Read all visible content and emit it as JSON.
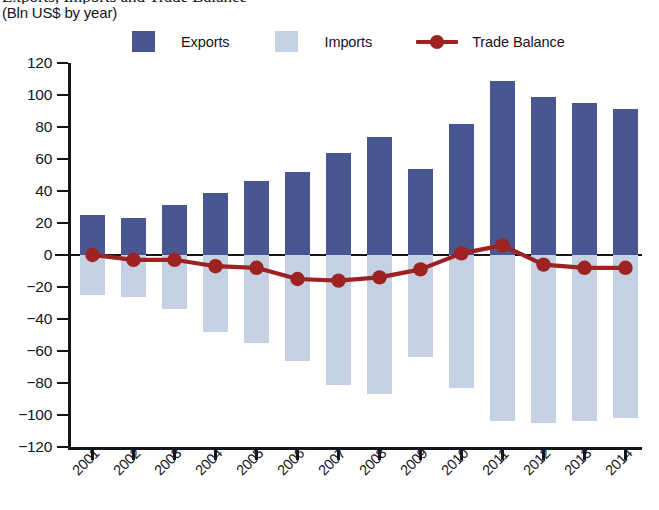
{
  "header": {
    "title": "Exports, Imports and Trade Balance",
    "subtitle": "(Bln US$ by year)"
  },
  "legend": {
    "items": [
      {
        "label": "Exports",
        "type": "swatch",
        "color": "#4a5691",
        "icon": "square-swatch"
      },
      {
        "label": "Imports",
        "type": "swatch",
        "color": "#c3d1e2",
        "icon": "square-swatch"
      },
      {
        "label": "Trade Balance",
        "type": "line",
        "color": "#9e2222",
        "icon": "line-marker"
      }
    ]
  },
  "colors": {
    "exports": "#4a5691",
    "imports": "#c3d1e2",
    "trade_balance": "#9e2222",
    "axis": "#15151d",
    "background": "#ffffff"
  },
  "chart_data": {
    "type": "bar",
    "title": "Exports, Imports and Trade Balance",
    "subtitle": "(Bln US$ by year)",
    "xlabel": "",
    "ylabel": "",
    "unit": "Bln US$",
    "grid": false,
    "legend_position": "top",
    "ylim": [
      -120,
      120
    ],
    "yticks": [
      120,
      100,
      80,
      60,
      40,
      20,
      0,
      -20,
      -40,
      -60,
      -80,
      -100,
      -120
    ],
    "ytick_labels": [
      "120",
      "100",
      "80",
      "60",
      "40",
      "20",
      "0",
      "−20",
      "−40",
      "−60",
      "−80",
      "−100",
      "−120"
    ],
    "categories": [
      "2001",
      "2002",
      "2003",
      "2004",
      "2005",
      "2006",
      "2007",
      "2008",
      "2009",
      "2010",
      "2011",
      "2012",
      "2013",
      "2014"
    ],
    "series": [
      {
        "name": "Exports",
        "kind": "bar",
        "color": "#4a5691",
        "values": [
          25,
          23,
          31,
          39,
          46,
          52,
          64,
          74,
          54,
          82,
          109,
          99,
          95,
          91
        ]
      },
      {
        "name": "Imports",
        "kind": "bar",
        "color": "#c3d1e2",
        "values": [
          -25,
          -26,
          -34,
          -48,
          -55,
          -66,
          -81,
          -87,
          -64,
          -83,
          -104,
          -105,
          -104,
          -102
        ]
      },
      {
        "name": "Trade Balance",
        "kind": "line",
        "color": "#9e2222",
        "values": [
          0,
          -3,
          -3,
          -7,
          -8,
          -15,
          -16,
          -14,
          -9,
          1,
          6,
          -6,
          -8,
          -8
        ]
      }
    ]
  }
}
